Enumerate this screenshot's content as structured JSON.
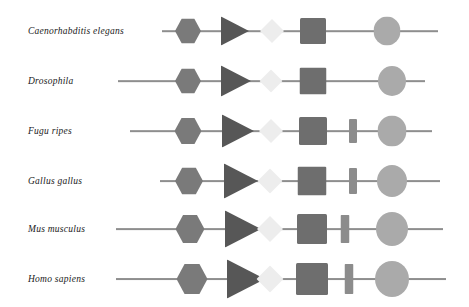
{
  "figure": {
    "type": "gene-structure-comparison",
    "background": "#ffffff",
    "width": 469,
    "height": 307
  },
  "palette": {
    "line": "#8e8e8e",
    "hexagon": "#7a7a7a",
    "triangle": "#575757",
    "diamond": "#ededed",
    "square": "#6e6e6e",
    "bar": "#8c8c8c",
    "ellipse": "#aaaaaa",
    "label_text": "#1a1a1a"
  },
  "glyph_legend": [
    {
      "key": "hexagon",
      "name": "hexagon-glyph",
      "color": "#7a7a7a"
    },
    {
      "key": "triangle",
      "name": "triangle-glyph",
      "color": "#575757"
    },
    {
      "key": "diamond",
      "name": "diamond-glyph",
      "color": "#ededed"
    },
    {
      "key": "square",
      "name": "square-glyph",
      "color": "#6e6e6e"
    },
    {
      "key": "bar",
      "name": "bar-glyph",
      "color": "#8c8c8c"
    },
    {
      "key": "ellipse",
      "name": "ellipse-glyph",
      "color": "#aaaaaa"
    }
  ],
  "rows": [
    {
      "label": "Caenorhabditis elegans",
      "label_x": 28,
      "y": 31,
      "line_start": 162,
      "line_end": 438,
      "line_width": 1.6,
      "glyphs": [
        {
          "key": "hexagon",
          "cx": 188,
          "w": 26,
          "h": 25
        },
        {
          "key": "triangle",
          "cx": 235,
          "w": 28,
          "h": 29
        },
        {
          "key": "diamond",
          "cx": 272,
          "w": 24,
          "h": 24
        },
        {
          "key": "square",
          "cx": 313,
          "w": 26,
          "h": 26
        },
        {
          "key": "ellipse",
          "cx": 387,
          "w": 27,
          "h": 29
        }
      ]
    },
    {
      "label": "Drosophila",
      "label_x": 28,
      "y": 81,
      "line_start": 118,
      "line_end": 425,
      "line_width": 1.7,
      "glyphs": [
        {
          "key": "hexagon",
          "cx": 188,
          "w": 26,
          "h": 25
        },
        {
          "key": "triangle",
          "cx": 236,
          "w": 30,
          "h": 31
        },
        {
          "key": "diamond",
          "cx": 271,
          "w": 23,
          "h": 23
        },
        {
          "key": "square",
          "cx": 313,
          "w": 27,
          "h": 27
        },
        {
          "key": "ellipse",
          "cx": 392,
          "w": 28,
          "h": 30
        }
      ]
    },
    {
      "label": "Fugu ripes",
      "label_x": 28,
      "y": 131,
      "line_start": 130,
      "line_end": 432,
      "line_width": 1.7,
      "glyphs": [
        {
          "key": "hexagon",
          "cx": 188,
          "w": 27,
          "h": 26
        },
        {
          "key": "triangle",
          "cx": 238,
          "w": 32,
          "h": 33
        },
        {
          "key": "diamond",
          "cx": 271,
          "w": 24,
          "h": 24
        },
        {
          "key": "square",
          "cx": 313,
          "w": 28,
          "h": 28
        },
        {
          "key": "bar",
          "cx": 353,
          "w": 8,
          "h": 24
        },
        {
          "key": "ellipse",
          "cx": 392,
          "w": 29,
          "h": 31
        }
      ]
    },
    {
      "label": "Gallus gallus",
      "label_x": 28,
      "y": 181,
      "line_start": 160,
      "line_end": 440,
      "line_width": 1.8,
      "glyphs": [
        {
          "key": "hexagon",
          "cx": 189,
          "w": 28,
          "h": 27
        },
        {
          "key": "triangle",
          "cx": 241,
          "w": 34,
          "h": 35
        },
        {
          "key": "diamond",
          "cx": 270,
          "w": 25,
          "h": 25
        },
        {
          "key": "square",
          "cx": 312,
          "w": 29,
          "h": 29
        },
        {
          "key": "bar",
          "cx": 353,
          "w": 8,
          "h": 26
        },
        {
          "key": "ellipse",
          "cx": 392,
          "w": 30,
          "h": 32
        }
      ]
    },
    {
      "label": "Mus musculus",
      "label_x": 28,
      "y": 229,
      "line_start": 116,
      "line_end": 443,
      "line_width": 1.8,
      "glyphs": [
        {
          "key": "hexagon",
          "cx": 190,
          "w": 29,
          "h": 28
        },
        {
          "key": "triangle",
          "cx": 243,
          "w": 36,
          "h": 37
        },
        {
          "key": "diamond",
          "cx": 270,
          "w": 26,
          "h": 26
        },
        {
          "key": "square",
          "cx": 312,
          "w": 30,
          "h": 30
        },
        {
          "key": "bar",
          "cx": 345,
          "w": 9,
          "h": 28
        },
        {
          "key": "ellipse",
          "cx": 392,
          "w": 32,
          "h": 34
        }
      ]
    },
    {
      "label": "Homo sapiens",
      "label_x": 28,
      "y": 279,
      "line_start": 116,
      "line_end": 446,
      "line_width": 1.9,
      "glyphs": [
        {
          "key": "hexagon",
          "cx": 192,
          "w": 31,
          "h": 30
        },
        {
          "key": "triangle",
          "cx": 246,
          "w": 38,
          "h": 39
        },
        {
          "key": "diamond",
          "cx": 270,
          "w": 27,
          "h": 27
        },
        {
          "key": "square",
          "cx": 312,
          "w": 32,
          "h": 32
        },
        {
          "key": "bar",
          "cx": 349,
          "w": 9,
          "h": 30
        },
        {
          "key": "ellipse",
          "cx": 392,
          "w": 34,
          "h": 36
        }
      ]
    }
  ]
}
